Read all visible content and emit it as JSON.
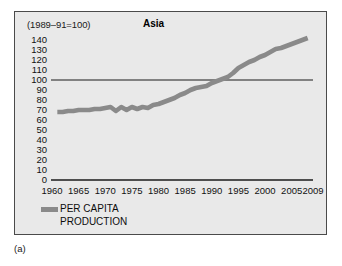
{
  "figure": {
    "caption": "(a)",
    "index_note": "(1989–91=100)"
  },
  "chart_data": {
    "type": "line",
    "title": "Asia",
    "subtitle": "(1989–91=100)",
    "xlabel": "",
    "ylabel": "",
    "xlim": [
      1960,
      2009
    ],
    "ylim": [
      0,
      145
    ],
    "grid": false,
    "legend_position": "below-left",
    "reference_line": {
      "value": 100,
      "label": "100"
    },
    "line_color": "#8a8a8a",
    "axis_color": "#1a1a1a",
    "background_color": "#e9e9e9",
    "frame_color": "#4a4a4a",
    "yticks": [
      0,
      10,
      20,
      30,
      40,
      50,
      60,
      70,
      80,
      90,
      100,
      110,
      120,
      130,
      140
    ],
    "xticks": [
      1960,
      1965,
      1970,
      1975,
      1980,
      1985,
      1990,
      1995,
      2000,
      2005,
      2009
    ],
    "series": [
      {
        "name": "PER CAPITA PRODUCTION",
        "legend_line1": "PER CAPITA",
        "legend_line2": "PRODUCTION",
        "color": "#8a8a8a",
        "x": [
          1961,
          1962,
          1963,
          1964,
          1965,
          1966,
          1967,
          1968,
          1969,
          1970,
          1971,
          1972,
          1973,
          1974,
          1975,
          1976,
          1977,
          1978,
          1979,
          1980,
          1981,
          1982,
          1983,
          1984,
          1985,
          1986,
          1987,
          1988,
          1989,
          1990,
          1991,
          1992,
          1993,
          1994,
          1995,
          1996,
          1997,
          1998,
          1999,
          2000,
          2001,
          2002,
          2003,
          2004,
          2005,
          2006,
          2007,
          2008
        ],
        "values": [
          68,
          68,
          69,
          69,
          70,
          70,
          70,
          71,
          71,
          72,
          73,
          69,
          73,
          70,
          73,
          71,
          73,
          72,
          75,
          76,
          78,
          80,
          82,
          85,
          87,
          90,
          92,
          93,
          94,
          97,
          99,
          101,
          103,
          107,
          112,
          115,
          118,
          120,
          123,
          125,
          128,
          131,
          132,
          134,
          136,
          138,
          140,
          142
        ]
      }
    ]
  }
}
